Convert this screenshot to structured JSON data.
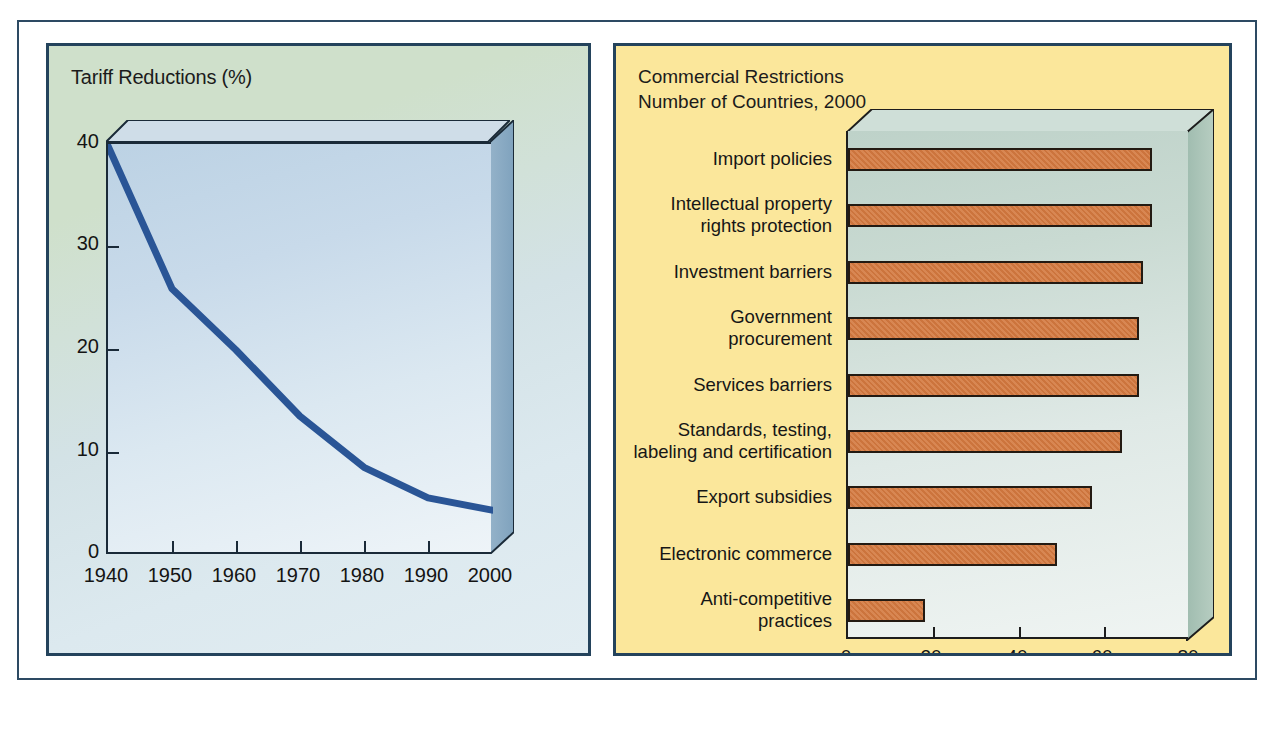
{
  "chart_data": [
    {
      "type": "line",
      "title": "Tariff Reductions (%)",
      "xlabel": "",
      "ylabel": "",
      "x": [
        1940,
        1950,
        1960,
        1970,
        1980,
        1990,
        2000
      ],
      "xtick_labels": [
        "1940",
        "1950",
        "1960",
        "1970",
        "1980",
        "1990",
        "2000"
      ],
      "ytick_labels": [
        "0",
        "10",
        "20",
        "30",
        "40"
      ],
      "yticks": [
        0,
        10,
        20,
        30,
        40
      ],
      "values": [
        40,
        26,
        20,
        13.5,
        8.5,
        5.5,
        4.3
      ],
      "xlim": [
        1940,
        2000
      ],
      "ylim": [
        0,
        40
      ],
      "grid": false,
      "legend": "none",
      "line_color": "#2a5596",
      "panel_background": "#cfe0cb",
      "plot_background": "#dbe8f1"
    },
    {
      "type": "bar",
      "orientation": "horizontal",
      "title": "Commercial Restrictions\nNumber of Countries, 2000",
      "xlabel": "",
      "ylabel": "",
      "categories": [
        "Import policies",
        "Intellectual property\nrights protection",
        "Investment barriers",
        "Government\nprocurement",
        "Services barriers",
        "Standards, testing,\nlabeling and certification",
        "Export subsidies",
        "Electronic commerce",
        "Anti-competitive\npractices"
      ],
      "values": [
        71,
        71,
        69,
        68,
        68,
        64,
        57,
        49,
        18
      ],
      "xtick_labels": [
        "0",
        "20",
        "40",
        "60",
        "80"
      ],
      "xticks": [
        0,
        20,
        40,
        60,
        80
      ],
      "xlim": [
        0,
        80
      ],
      "grid": false,
      "legend": "none",
      "bar_color": "#d4793f",
      "panel_background": "#fbe79b",
      "plot_background": "#dfe9e6"
    }
  ],
  "figure": {
    "border_color": "#2d4a63",
    "background": "#ffffff"
  },
  "left": {
    "title": "Tariff Reductions (%)",
    "y_labels": [
      "40",
      "30",
      "20",
      "10",
      "0"
    ],
    "x_labels": [
      "1940",
      "1950",
      "1960",
      "1970",
      "1980",
      "1990",
      "2000"
    ]
  },
  "right": {
    "title": "Commercial Restrictions\nNumber of Countries, 2000",
    "bar_labels": [
      "Import policies",
      "Intellectual property\nrights protection",
      "Investment barriers",
      "Government\nprocurement",
      "Services barriers",
      "Standards, testing,\nlabeling and certification",
      "Export subsidies",
      "Electronic commerce",
      "Anti-competitive\npractices"
    ],
    "x_labels": [
      "0",
      "20",
      "40",
      "60",
      "80"
    ]
  }
}
